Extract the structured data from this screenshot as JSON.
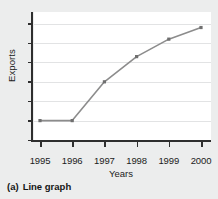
{
  "figure": {
    "caption_label": "(a)",
    "caption_text": "Line graph"
  },
  "chart_data": {
    "type": "line",
    "title": "",
    "xlabel": "Years",
    "ylabel": "Exports",
    "categories": [
      "1995",
      "1996",
      "1997",
      "1998",
      "1999",
      "2000"
    ],
    "x": [
      1995,
      1996,
      1997,
      1998,
      1999,
      2000
    ],
    "values": [
      1.0,
      1.0,
      3.0,
      4.3,
      5.2,
      5.8
    ],
    "series": [
      {
        "name": "Exports",
        "values": [
          1.0,
          1.0,
          3.0,
          4.3,
          5.2,
          5.8
        ]
      }
    ],
    "ylim": [
      0,
      6.6
    ],
    "xlim": [
      1994.7,
      2000.3
    ],
    "yticks": [
      0,
      1,
      2,
      3,
      4,
      5,
      6
    ],
    "ytick_labels": [
      "",
      "",
      "",
      "",
      "",
      "",
      ""
    ],
    "grid": true,
    "grid_axis": "y",
    "legend": false,
    "legend_position": "none",
    "line_color": "#8c8c8c",
    "marker": "square",
    "marker_color": "#6f6f6f",
    "axis_color": "#2e2e2e",
    "grid_color": "#e2e3e4",
    "plot_background": "#ffffff",
    "page_background": "#eceded"
  }
}
